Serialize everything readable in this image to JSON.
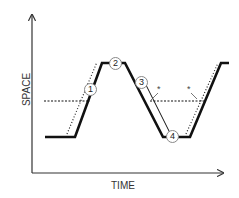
{
  "diagram": {
    "axes": {
      "y_label": "SPACE",
      "x_label": "TIME"
    },
    "markers": [
      {
        "label": "1",
        "x": 89,
        "y": 88
      },
      {
        "label": "2",
        "x": 114,
        "y": 57
      },
      {
        "label": "3",
        "x": 140,
        "y": 81
      },
      {
        "label": "4",
        "x": 172,
        "y": 131
      }
    ],
    "stars": [
      {
        "label": "*",
        "x": 157,
        "y": 86
      },
      {
        "label": "*",
        "x": 188,
        "y": 86
      }
    ],
    "colors": {
      "line": "#111111",
      "axis": "#333333"
    }
  }
}
